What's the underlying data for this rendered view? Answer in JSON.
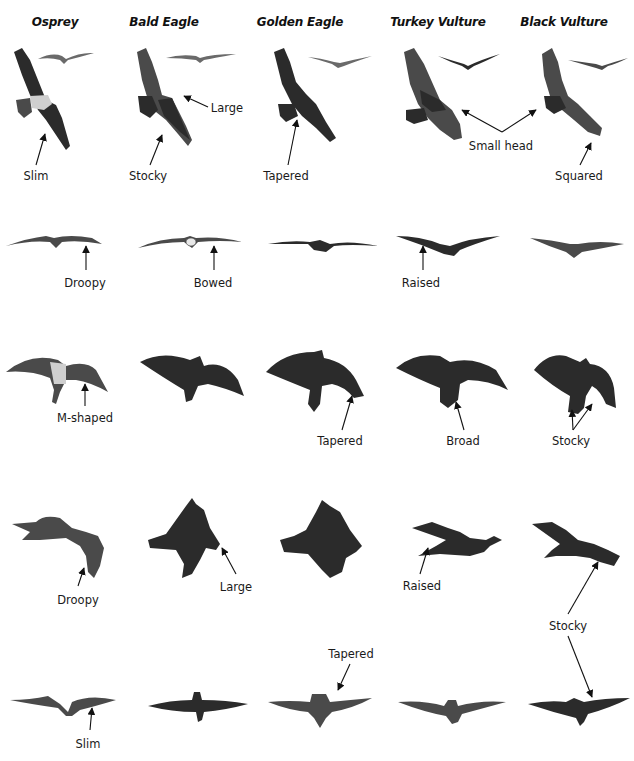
{
  "figure": {
    "type": "raptor-silhouette-comparison",
    "columns": [
      {
        "id": "osprey",
        "label": "Osprey"
      },
      {
        "id": "bald-eagle",
        "label": "Bald Eagle"
      },
      {
        "id": "golden-eagle",
        "label": "Golden Eagle"
      },
      {
        "id": "turkey-vulture",
        "label": "Turkey Vulture"
      },
      {
        "id": "black-vulture",
        "label": "Black Vulture"
      }
    ],
    "rows": [
      {
        "view": "soaring-from-below",
        "annotations": [
          {
            "column": "osprey",
            "text": "Slim"
          },
          {
            "column": "bald-eagle",
            "text": "Stocky"
          },
          {
            "column": "bald-eagle",
            "text": "Large"
          },
          {
            "column": "golden-eagle",
            "text": "Tapered"
          },
          {
            "column": "turkey-vulture,black-vulture",
            "text": "Small head"
          },
          {
            "column": "black-vulture",
            "text": "Squared"
          }
        ]
      },
      {
        "view": "head-on-soaring",
        "annotations": [
          {
            "column": "osprey",
            "text": "Droopy"
          },
          {
            "column": "bald-eagle",
            "text": "Bowed"
          },
          {
            "column": "turkey-vulture",
            "text": "Raised"
          }
        ]
      },
      {
        "view": "banking-from-below",
        "annotations": [
          {
            "column": "osprey",
            "text": "M-shaped"
          },
          {
            "column": "golden-eagle",
            "text": "Tapered"
          },
          {
            "column": "turkey-vulture",
            "text": "Broad"
          },
          {
            "column": "black-vulture",
            "text": "Stocky"
          }
        ]
      },
      {
        "view": "side-profile",
        "annotations": [
          {
            "column": "osprey",
            "text": "Droopy"
          },
          {
            "column": "bald-eagle",
            "text": "Large"
          },
          {
            "column": "turkey-vulture",
            "text": "Raised"
          },
          {
            "column": "black-vulture",
            "text": "Stocky"
          }
        ]
      },
      {
        "view": "gliding-from-above",
        "annotations": [
          {
            "column": "osprey",
            "text": "Slim"
          },
          {
            "column": "golden-eagle",
            "text": "Tapered"
          }
        ]
      }
    ]
  },
  "labels": {
    "row1": {
      "slim": "Slim",
      "stocky": "Stocky",
      "large": "Large",
      "tapered": "Tapered",
      "small_head": "Small head",
      "squared": "Squared"
    },
    "row2": {
      "droopy": "Droopy",
      "bowed": "Bowed",
      "raised": "Raised"
    },
    "row3": {
      "m_shaped": "M-shaped",
      "tapered": "Tapered",
      "broad": "Broad",
      "stocky": "Stocky"
    },
    "row4": {
      "droopy": "Droopy",
      "large": "Large",
      "raised": "Raised",
      "stocky": "Stocky"
    },
    "row5": {
      "tapered": "Tapered",
      "slim": "Slim"
    }
  },
  "colors": {
    "background": "#ffffff",
    "silhouette": "#2b2b2b",
    "text": "#1a1a1a"
  }
}
